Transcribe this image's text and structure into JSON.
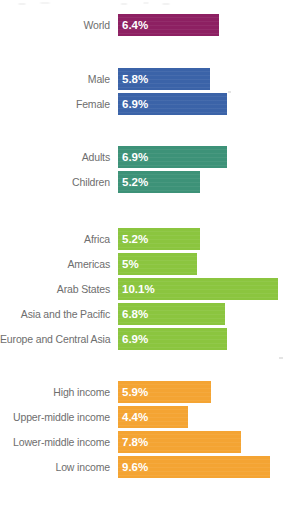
{
  "chart_data": {
    "type": "bar",
    "title": "",
    "subtitle": "",
    "xlabel": "",
    "ylabel": "",
    "orientation": "horizontal",
    "grid": false,
    "legend": false,
    "xlim": [
      0,
      11.5
    ],
    "unit": "%",
    "axis_start_px": 118,
    "px_per_unit": 15.8,
    "groups": [
      {
        "name": "overall",
        "color": "#8d2062",
        "categories": [
          "World"
        ],
        "values": [
          6.4
        ],
        "labels": [
          "6.4%"
        ]
      },
      {
        "name": "sex",
        "color": "#3b63a8",
        "categories": [
          "Male",
          "Female"
        ],
        "values": [
          5.8,
          6.9
        ],
        "labels": [
          "5.8%",
          "6.9%"
        ]
      },
      {
        "name": "age",
        "color": "#3d9278",
        "categories": [
          "Adults",
          "Children"
        ],
        "values": [
          6.9,
          5.2
        ],
        "labels": [
          "6.9%",
          "5.2%"
        ]
      },
      {
        "name": "region",
        "color": "#8bc53f",
        "categories": [
          "Africa",
          "Americas",
          "Arab States",
          "Asia and the Pacific",
          "Europe and Central Asia"
        ],
        "values": [
          5.2,
          5.0,
          10.1,
          6.8,
          6.9
        ],
        "labels": [
          "5.2%",
          "5%",
          "10.1%",
          "6.8%",
          "6.9%"
        ]
      },
      {
        "name": "income",
        "color": "#f4a433",
        "categories": [
          "High income",
          "Upper-middle income",
          "Lower-middle income",
          "Low income"
        ],
        "values": [
          5.9,
          4.4,
          7.8,
          9.6
        ],
        "labels": [
          "5.9%",
          "4.4%",
          "7.8%",
          "9.6%"
        ]
      }
    ]
  },
  "colors": {
    "overall": "#8d2062",
    "sex": "#3b63a8",
    "age": "#3d9278",
    "region": "#8bc53f",
    "income": "#f4a433",
    "label_text": "#6e6e6e",
    "value_text": "#ffffff",
    "background": "#ffffff"
  }
}
